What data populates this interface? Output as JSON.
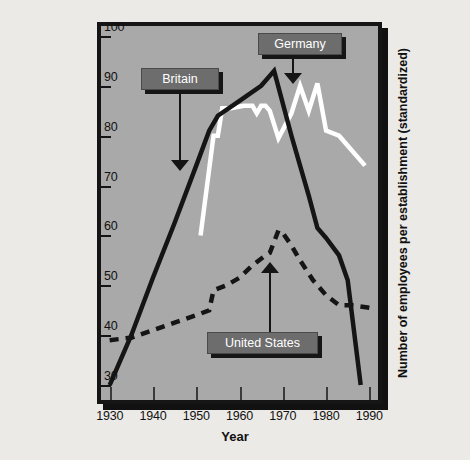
{
  "chart_data": {
    "type": "line",
    "title": "",
    "xlabel": "Year",
    "ylabel": "Number of employees per establishment (standardized)",
    "xlim": [
      1928,
      1992
    ],
    "ylim": [
      27,
      102
    ],
    "xticks": [
      1930,
      1940,
      1950,
      1960,
      1970,
      1980,
      1990
    ],
    "yticks": [
      30,
      40,
      50,
      60,
      70,
      80,
      90,
      100
    ],
    "grid": false,
    "legend": "inline-callouts",
    "series": [
      {
        "name": "Britain",
        "style": "solid",
        "color": "#151515",
        "points": [
          [
            1930,
            30.0
          ],
          [
            1935,
            40.0
          ],
          [
            1940,
            51.5
          ],
          [
            1945,
            62.5
          ],
          [
            1950,
            74.0
          ],
          [
            1953,
            81.0
          ],
          [
            1955,
            84.0
          ],
          [
            1960,
            87.0
          ],
          [
            1965,
            90.0
          ],
          [
            1968,
            93.0
          ],
          [
            1972,
            80.0
          ],
          [
            1976,
            68.0
          ],
          [
            1978,
            61.5
          ],
          [
            1980,
            59.5
          ],
          [
            1983,
            56.0
          ],
          [
            1985,
            51.0
          ],
          [
            1988,
            30.0
          ]
        ]
      },
      {
        "name": "Germany",
        "style": "solid",
        "color": "#ffffff",
        "points": [
          [
            1951,
            60.0
          ],
          [
            1954,
            80.0
          ],
          [
            1955,
            80.0
          ],
          [
            1956,
            85.5
          ],
          [
            1958,
            85.5
          ],
          [
            1961,
            86.0
          ],
          [
            1963,
            86.0
          ],
          [
            1964,
            84.5
          ],
          [
            1965,
            86.0
          ],
          [
            1966,
            86.0
          ],
          [
            1967,
            85.0
          ],
          [
            1969,
            79.5
          ],
          [
            1972,
            84.5
          ],
          [
            1974,
            90.0
          ],
          [
            1976,
            85.0
          ],
          [
            1978,
            90.5
          ],
          [
            1980,
            81.0
          ],
          [
            1983,
            80.0
          ],
          [
            1989,
            74.0
          ]
        ]
      },
      {
        "name": "United States",
        "style": "dashed",
        "color": "#151515",
        "points": [
          [
            1930,
            39.0
          ],
          [
            1935,
            39.5
          ],
          [
            1940,
            41.0
          ],
          [
            1945,
            42.5
          ],
          [
            1950,
            44.0
          ],
          [
            1953,
            45.0
          ],
          [
            1954,
            49.0
          ],
          [
            1957,
            50.0
          ],
          [
            1960,
            51.5
          ],
          [
            1963,
            54.0
          ],
          [
            1966,
            56.0
          ],
          [
            1967,
            56.5
          ],
          [
            1969,
            61.0
          ],
          [
            1970,
            60.5
          ],
          [
            1972,
            58.0
          ],
          [
            1974,
            55.0
          ],
          [
            1977,
            51.0
          ],
          [
            1980,
            48.0
          ],
          [
            1983,
            46.0
          ],
          [
            1986,
            46.0
          ],
          [
            1990,
            45.5
          ]
        ]
      }
    ],
    "annotations": [
      {
        "label": "Britain",
        "points_to": "britain-line",
        "arrow": "down"
      },
      {
        "label": "Germany",
        "points_to": "germany-line",
        "arrow": "down"
      },
      {
        "label": "United States",
        "points_to": "united-states-line",
        "arrow": "up"
      }
    ]
  },
  "axis": {
    "x_title": "Year",
    "y_title": "Number of employees per establishment (standardized)",
    "x_labels": [
      "1930",
      "1940",
      "1950",
      "1960",
      "1970",
      "1980",
      "1990"
    ],
    "y_labels": [
      "100",
      "90",
      "80",
      "70",
      "60",
      "50",
      "40",
      "30"
    ]
  },
  "callouts": {
    "britain": "Britain",
    "germany": "Germany",
    "united_states": "United States"
  },
  "colors": {
    "page_background": "#eceae6",
    "plot_background": "#a9a9a9",
    "frame": "#151515",
    "callout_box": "#6d6d6d",
    "britain_line": "#151515",
    "germany_line": "#ffffff",
    "united_states_line": "#151515"
  }
}
